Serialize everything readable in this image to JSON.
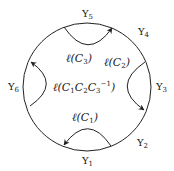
{
  "diagram": {
    "type": "hyperbolic-disk-geodesics",
    "boundary_labels": [
      {
        "id": "g1",
        "text": "Υ₁",
        "base": "Υ",
        "sub": "1"
      },
      {
        "id": "g2",
        "text": "Υ₂",
        "base": "Υ",
        "sub": "2"
      },
      {
        "id": "g3",
        "text": "Υ₃",
        "base": "Υ",
        "sub": "3"
      },
      {
        "id": "g4",
        "text": "Υ₄",
        "base": "Υ",
        "sub": "4"
      },
      {
        "id": "g5",
        "text": "Υ₅",
        "base": "Υ",
        "sub": "5"
      },
      {
        "id": "g6",
        "text": "Υ₆",
        "base": "Υ",
        "sub": "6"
      }
    ],
    "arc_labels": {
      "c1": {
        "pre": "ℓ(C",
        "sub": "1",
        "post": ")"
      },
      "c2": {
        "pre": "ℓ(C",
        "sub": "2",
        "post": ")"
      },
      "c3": {
        "pre": "ℓ(C",
        "sub": "3",
        "post": ")"
      },
      "center": {
        "text": "ℓ(C₁C₂C₃⁻¹)",
        "p1": "ℓ(C",
        "s1": "1",
        "p2": "C",
        "s2": "2",
        "p3": "C",
        "s3": "3",
        "sup": "−1",
        "p4": ")"
      }
    },
    "arcs": [
      {
        "name": "C1",
        "position": "bottom",
        "arrow": "left end"
      },
      {
        "name": "C2",
        "position": "right",
        "arrow": "bottom end"
      },
      {
        "name": "C3",
        "position": "top",
        "arrow": "right end"
      },
      {
        "name": "C1C2C3^-1",
        "position": "left",
        "arrow": "top end"
      }
    ],
    "stroke_color": "#222222"
  }
}
